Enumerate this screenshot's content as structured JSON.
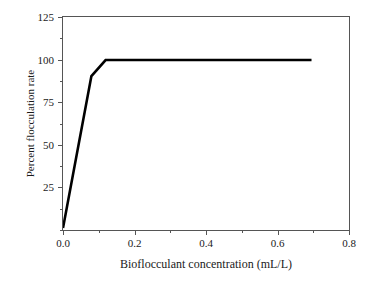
{
  "chart_data": {
    "type": "line",
    "title": "",
    "xlabel": "Bioflocculant concentration (mL/L)",
    "ylabel": "Percent flocculation rate",
    "xlim": [
      0.0,
      0.8
    ],
    "ylim": [
      0,
      125
    ],
    "grid": false,
    "legend": null,
    "x_ticks": [
      {
        "value": 0.0,
        "label": "0.0",
        "major": true
      },
      {
        "value": 0.1,
        "label": "",
        "major": false
      },
      {
        "value": 0.2,
        "label": "0.2",
        "major": true
      },
      {
        "value": 0.3,
        "label": "",
        "major": false
      },
      {
        "value": 0.4,
        "label": "0.4",
        "major": true
      },
      {
        "value": 0.5,
        "label": "",
        "major": false
      },
      {
        "value": 0.6,
        "label": "0.6",
        "major": true
      },
      {
        "value": 0.7,
        "label": "",
        "major": false
      },
      {
        "value": 0.8,
        "label": "0.8",
        "major": true
      }
    ],
    "y_ticks": [
      {
        "value": 0,
        "label": "",
        "major": false
      },
      {
        "value": 12.5,
        "label": "",
        "major": false
      },
      {
        "value": 25,
        "label": "25",
        "major": true
      },
      {
        "value": 37.5,
        "label": "",
        "major": false
      },
      {
        "value": 50,
        "label": "50",
        "major": true
      },
      {
        "value": 62.5,
        "label": "",
        "major": false
      },
      {
        "value": 75,
        "label": "75",
        "major": true
      },
      {
        "value": 87.5,
        "label": "",
        "major": false
      },
      {
        "value": 100,
        "label": "100",
        "major": true
      },
      {
        "value": 112.5,
        "label": "",
        "major": false
      },
      {
        "value": 125,
        "label": "125",
        "major": true
      }
    ],
    "series": [
      {
        "name": "Percent flocculation rate",
        "color": "#000000",
        "line_width": 2.6,
        "x": [
          0.0,
          0.08,
          0.12,
          0.7
        ],
        "values": [
          0.0,
          90.0,
          99.5,
          99.5
        ]
      }
    ]
  }
}
